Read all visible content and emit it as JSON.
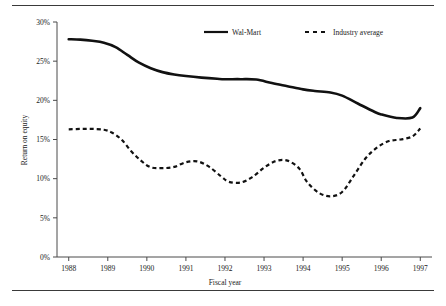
{
  "chart_data": {
    "type": "line",
    "title": "",
    "xlabel": "Fiscal year",
    "ylabel": "Return on equity",
    "x": [
      1988,
      1989,
      1990,
      1991,
      1992,
      1993,
      1994,
      1995,
      1996,
      1997
    ],
    "xtick_labels": [
      "1988",
      "1989",
      "1990",
      "1991",
      "1992",
      "1993",
      "1994",
      "1995",
      "1996",
      "1997"
    ],
    "ytick_labels": [
      "0%",
      "5%",
      "10%",
      "15%",
      "20%",
      "25%",
      "30%"
    ],
    "ytick_values": [
      0,
      5,
      10,
      15,
      20,
      25,
      30
    ],
    "ylim": [
      0,
      30
    ],
    "xlim": [
      1987.7,
      1997.3
    ],
    "grid": false,
    "legend_position": "top-right",
    "series": [
      {
        "name": "Wal-Mart",
        "style": "solid",
        "color": "#111111",
        "values": [
          27.8,
          27.3,
          24.2,
          23.1,
          22.7,
          22.7,
          21.4,
          20.7,
          18.4,
          19.0
        ],
        "dense_x": [
          1988.0,
          1988.3,
          1988.6,
          1988.9,
          1989.2,
          1989.5,
          1989.8,
          1990.1,
          1990.4,
          1990.7,
          1991.0,
          1991.4,
          1991.8,
          1992.0,
          1992.4,
          1992.8,
          1993.2,
          1993.6,
          1994.0,
          1994.3,
          1994.7,
          1995.0,
          1995.4,
          1995.8,
          1996.0,
          1996.4,
          1996.8,
          1997.0
        ],
        "dense_y": [
          27.8,
          27.75,
          27.6,
          27.35,
          26.8,
          25.8,
          24.8,
          24.1,
          23.6,
          23.3,
          23.1,
          22.9,
          22.75,
          22.7,
          22.7,
          22.65,
          22.2,
          21.8,
          21.4,
          21.2,
          21.0,
          20.6,
          19.6,
          18.6,
          18.2,
          17.75,
          17.8,
          19.0
        ]
      },
      {
        "name": "Industry average",
        "style": "dashed",
        "color": "#111111",
        "values": [
          16.3,
          16.3,
          11.4,
          12.2,
          9.5,
          12.3,
          7.8,
          14.8,
          15.0,
          16.4
        ],
        "dense_x": [
          1988.0,
          1988.3,
          1988.6,
          1988.9,
          1989.1,
          1989.35,
          1989.6,
          1989.85,
          1990.1,
          1990.4,
          1990.7,
          1991.0,
          1991.3,
          1991.6,
          1991.9,
          1992.1,
          1992.4,
          1992.7,
          1993.0,
          1993.3,
          1993.6,
          1993.9,
          1994.1,
          1994.4,
          1994.7,
          1995.0,
          1995.3,
          1995.6,
          1995.9,
          1996.2,
          1996.5,
          1996.8,
          1997.0
        ],
        "dense_y": [
          16.3,
          16.35,
          16.35,
          16.25,
          15.9,
          15.0,
          13.5,
          12.3,
          11.45,
          11.35,
          11.5,
          12.1,
          12.2,
          11.5,
          10.3,
          9.6,
          9.5,
          10.2,
          11.4,
          12.25,
          12.3,
          11.3,
          9.6,
          8.2,
          7.75,
          8.3,
          10.4,
          12.6,
          14.0,
          14.8,
          15.0,
          15.4,
          16.4
        ]
      }
    ]
  },
  "chart": {
    "xlabel": "Fiscal year",
    "ylabel": "Return on equity",
    "legend": {
      "items": [
        {
          "label": "Wal-Mart",
          "style": "solid"
        },
        {
          "label": "Industry average",
          "style": "dashed"
        }
      ]
    }
  }
}
